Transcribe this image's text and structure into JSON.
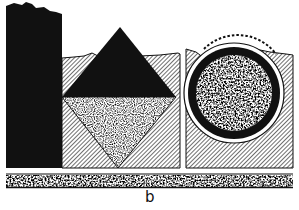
{
  "figure": {
    "label": "b",
    "colors": {
      "ink": "#111111",
      "paper": "#ffffff",
      "hatch": "#222222"
    },
    "parts": [
      {
        "name": "solid-column",
        "fill": "solid-black"
      },
      {
        "name": "diamond-panel",
        "fill": "diagonal-hatch",
        "contains": [
          "upper-triangle-black",
          "lower-triangle-stippled"
        ]
      },
      {
        "name": "circle-panel",
        "fill": "diagonal-hatch",
        "contains": [
          "dashed-arc",
          "white-ring",
          "black-ring",
          "stippled-core"
        ]
      },
      {
        "name": "base-strip",
        "fill": "stipple"
      }
    ]
  }
}
